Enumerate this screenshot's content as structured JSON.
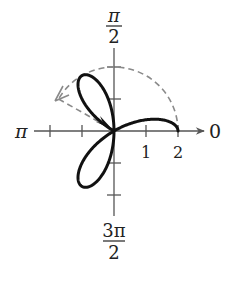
{
  "diagram": {
    "type": "polar-graph",
    "curve": {
      "equation": "r = 2cos(3θ)",
      "theta_range": [
        0,
        2.618
      ],
      "stroke_color": "#111111",
      "description": "Three-petal rose traced partially: upper half of 0-direction petal, full petal toward 4π/3, full petal toward 2π/3"
    },
    "dashed_path": {
      "color": "#888888",
      "description": "Dashed circular arc of radius 2 from θ=0 counterclockwise to about 5π/6, then dashed segment back to pole with arrowhead"
    },
    "axis_labels": {
      "right": "0",
      "top_num": "π",
      "top_den": "2",
      "left": "π",
      "bottom_num": "3π",
      "bottom_den": "2"
    },
    "tick_labels": [
      "1",
      "2"
    ],
    "colors": {
      "axis": "#555555",
      "curve": "#111111",
      "dashed": "#8a8a8a",
      "background": "#ffffff"
    }
  }
}
